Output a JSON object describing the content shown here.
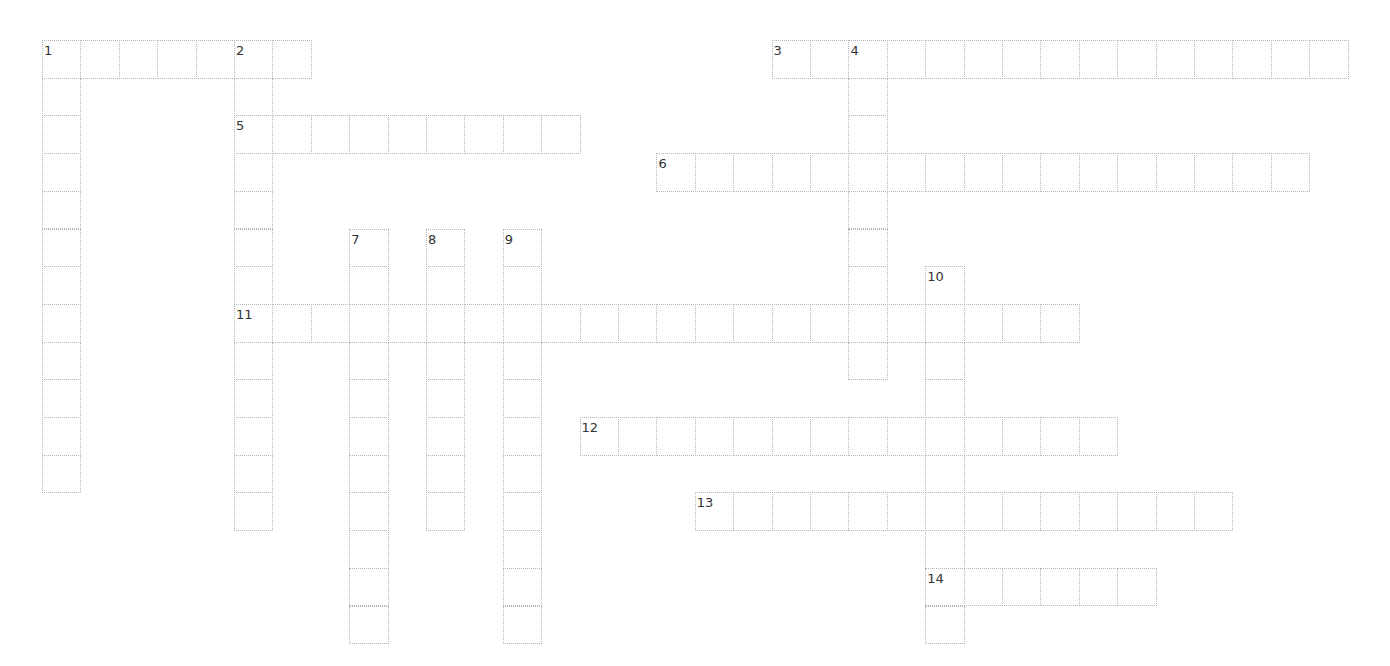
{
  "puzzle": {
    "layout": {
      "origin_x": 42,
      "origin_y": 40,
      "cell_w": 38.4,
      "cell_h": 37.7
    },
    "entries": [
      {
        "number": "1",
        "direction": "across",
        "row": 0,
        "col": 0,
        "length": 7
      },
      {
        "number": "1",
        "direction": "down",
        "row": 0,
        "col": 0,
        "length": 12
      },
      {
        "number": "2",
        "direction": "down",
        "row": 0,
        "col": 5,
        "length": 13
      },
      {
        "number": "3",
        "direction": "across",
        "row": 0,
        "col": 19,
        "length": 15
      },
      {
        "number": "4",
        "direction": "down",
        "row": 0,
        "col": 21,
        "length": 9
      },
      {
        "number": "5",
        "direction": "across",
        "row": 2,
        "col": 5,
        "length": 9
      },
      {
        "number": "6",
        "direction": "across",
        "row": 3,
        "col": 16,
        "length": 17
      },
      {
        "number": "7",
        "direction": "down",
        "row": 5,
        "col": 8,
        "length": 11
      },
      {
        "number": "8",
        "direction": "down",
        "row": 5,
        "col": 10,
        "length": 8
      },
      {
        "number": "9",
        "direction": "down",
        "row": 5,
        "col": 12,
        "length": 11
      },
      {
        "number": "10",
        "direction": "down",
        "row": 6,
        "col": 23,
        "length": 10
      },
      {
        "number": "11",
        "direction": "across",
        "row": 7,
        "col": 5,
        "length": 22
      },
      {
        "number": "12",
        "direction": "across",
        "row": 10,
        "col": 14,
        "length": 14
      },
      {
        "number": "13",
        "direction": "across",
        "row": 12,
        "col": 17,
        "length": 14
      },
      {
        "number": "14",
        "direction": "across",
        "row": 14,
        "col": 23,
        "length": 6
      }
    ]
  },
  "colors": {
    "grid_line": "#b5b5b5",
    "number_text": "#333333",
    "background": "#ffffff"
  }
}
